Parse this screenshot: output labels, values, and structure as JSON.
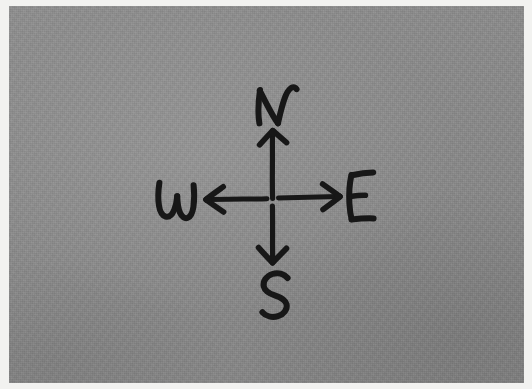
{
  "image": {
    "kind": "hand-drawn-sketch",
    "subject": "compass rose",
    "medium": "black marker on grey paper",
    "width": 532,
    "height": 389,
    "alt_text": "Hand-drawn compass rose: a four-way cross of arrows labelled N at top, S at bottom, W at left and E at right."
  },
  "colors": {
    "paper": "#8b8b8b",
    "ink": "#171717",
    "frame": "#f2f2f0"
  },
  "compass": {
    "center": {
      "x": 272,
      "y": 198
    },
    "directions": [
      {
        "id": "north",
        "label": "N",
        "arrow": "arrow-up",
        "label_x": 281,
        "label_y": 100,
        "tip_x": 272,
        "tip_y": 129,
        "tail_x": 272,
        "tail_y": 198
      },
      {
        "id": "south",
        "label": "S",
        "arrow": "arrow-down",
        "label_x": 275,
        "label_y": 291,
        "tip_x": 272,
        "tip_y": 259,
        "tail_x": 272,
        "tail_y": 198
      },
      {
        "id": "west",
        "label": "W",
        "arrow": "arrow-left",
        "label_x": 174,
        "label_y": 199,
        "tip_x": 205,
        "tip_y": 199,
        "tail_x": 267,
        "tail_y": 199
      },
      {
        "id": "east",
        "label": "E",
        "arrow": "arrow-right",
        "label_x": 360,
        "label_y": 196,
        "tip_x": 338,
        "tip_y": 196,
        "tail_x": 281,
        "tail_y": 197
      }
    ]
  },
  "labels": {
    "north": "N",
    "south": "S",
    "west": "W",
    "east": "E"
  }
}
